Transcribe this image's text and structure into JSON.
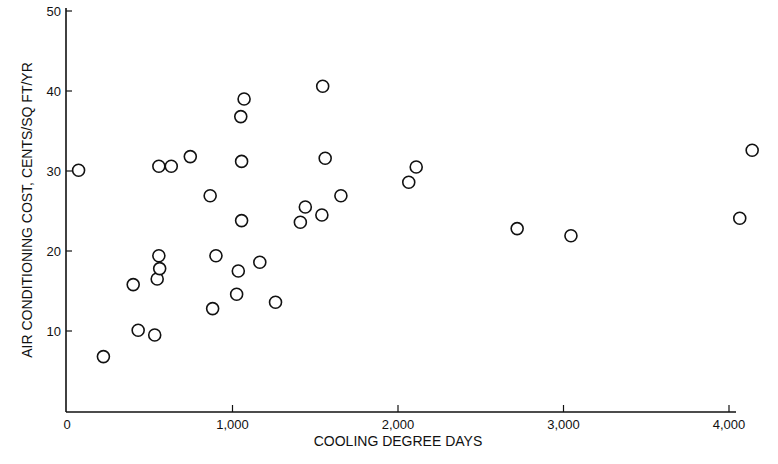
{
  "chart_data": {
    "type": "scatter",
    "title": "",
    "xlabel": "COOLING DEGREE DAYS",
    "ylabel": "AIR CONDITIONING COST, CENTS/SQ FT/YR",
    "xlim": [
      0,
      4000
    ],
    "ylim": [
      0,
      50
    ],
    "grid": false,
    "legend": null,
    "marker": "open-circle",
    "x_ticks": [
      {
        "value": 0,
        "label": "0"
      },
      {
        "value": 1000,
        "label": "1,000"
      },
      {
        "value": 2000,
        "label": "2,000"
      },
      {
        "value": 3000,
        "label": "3,000"
      },
      {
        "value": 4000,
        "label": "4,000"
      }
    ],
    "y_ticks": [
      {
        "value": 10,
        "label": "10"
      },
      {
        "value": 20,
        "label": "20"
      },
      {
        "value": 30,
        "label": "30"
      },
      {
        "value": 40,
        "label": "40"
      },
      {
        "value": 50,
        "label": "50"
      }
    ],
    "points": [
      {
        "x": 70,
        "y": 30.1
      },
      {
        "x": 220,
        "y": 6.8
      },
      {
        "x": 400,
        "y": 15.8
      },
      {
        "x": 430,
        "y": 10.1
      },
      {
        "x": 530,
        "y": 9.5
      },
      {
        "x": 545,
        "y": 16.5
      },
      {
        "x": 555,
        "y": 19.4
      },
      {
        "x": 560,
        "y": 17.8
      },
      {
        "x": 555,
        "y": 30.6
      },
      {
        "x": 630,
        "y": 30.6
      },
      {
        "x": 745,
        "y": 31.8
      },
      {
        "x": 865,
        "y": 26.9
      },
      {
        "x": 880,
        "y": 12.8
      },
      {
        "x": 900,
        "y": 19.4
      },
      {
        "x": 1025,
        "y": 14.6
      },
      {
        "x": 1035,
        "y": 17.5
      },
      {
        "x": 1050,
        "y": 36.8
      },
      {
        "x": 1055,
        "y": 23.8
      },
      {
        "x": 1055,
        "y": 31.2
      },
      {
        "x": 1070,
        "y": 39.0
      },
      {
        "x": 1165,
        "y": 18.6
      },
      {
        "x": 1260,
        "y": 13.6
      },
      {
        "x": 1410,
        "y": 23.6
      },
      {
        "x": 1440,
        "y": 25.5
      },
      {
        "x": 1540,
        "y": 24.5
      },
      {
        "x": 1545,
        "y": 40.6
      },
      {
        "x": 1560,
        "y": 31.6
      },
      {
        "x": 1655,
        "y": 26.9
      },
      {
        "x": 2065,
        "y": 28.6
      },
      {
        "x": 2110,
        "y": 30.5
      },
      {
        "x": 2720,
        "y": 22.8
      },
      {
        "x": 3045,
        "y": 21.9
      },
      {
        "x": 4065,
        "y": 24.1
      },
      {
        "x": 4140,
        "y": 32.6
      }
    ]
  },
  "colors": {
    "ink": "#111111",
    "background": "#ffffff"
  }
}
